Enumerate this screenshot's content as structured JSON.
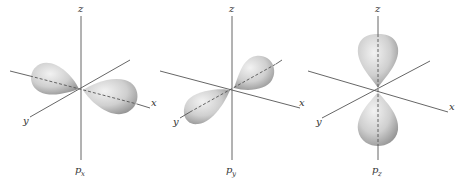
{
  "diagram": {
    "panels": [
      {
        "id": "px",
        "axis_labels": {
          "z": "z",
          "x": "x",
          "y": "y"
        },
        "caption_main": "p",
        "caption_sub": "x",
        "lobe_axis": "x"
      },
      {
        "id": "py",
        "axis_labels": {
          "z": "z",
          "x": "x",
          "y": "y"
        },
        "caption_main": "p",
        "caption_sub": "y",
        "lobe_axis": "y"
      },
      {
        "id": "pz",
        "axis_labels": {
          "z": "z",
          "x": "x",
          "y": "y"
        },
        "caption_main": "p",
        "caption_sub": "z",
        "lobe_axis": "z"
      }
    ],
    "colors": {
      "axis": "#555555",
      "lobe_light": "#eeeeee",
      "lobe_dark": "#9a9a9a",
      "background": "#ffffff"
    }
  }
}
